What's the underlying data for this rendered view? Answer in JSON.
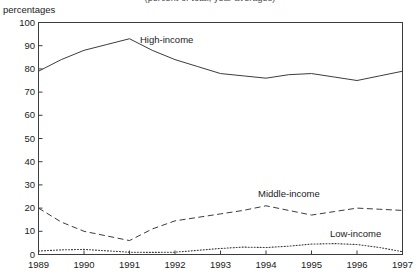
{
  "figure": {
    "clipped_title": "(percent of total, year averages)",
    "unit_label": "percentages"
  },
  "chart_data": {
    "type": "line",
    "title": "",
    "xlabel": "",
    "ylabel": "percentages",
    "ylim": [
      0,
      100
    ],
    "xlim": [
      1989,
      1997
    ],
    "ytick_labels": [
      "0",
      "10",
      "20",
      "30",
      "40",
      "50",
      "60",
      "70",
      "80",
      "90",
      "100"
    ],
    "ytick_values": [
      0,
      10,
      20,
      30,
      40,
      50,
      60,
      70,
      80,
      90,
      100
    ],
    "xtick_labels": [
      "1989",
      "1990",
      "1991",
      "1992",
      "1993",
      "1994",
      "1995",
      "1996",
      "1997"
    ],
    "xtick_values": [
      1989,
      1990,
      1991,
      1992,
      1993,
      1994,
      1995,
      1996,
      1997
    ],
    "grid": false,
    "legend_position": "inline-annotations",
    "x": [
      1989,
      1989.5,
      1990,
      1990.5,
      1991,
      1991.5,
      1992,
      1992.5,
      1993,
      1993.5,
      1994,
      1994.5,
      1995,
      1995.5,
      1996,
      1996.5,
      1997
    ],
    "series": [
      {
        "name": "High-income",
        "style": "solid",
        "color": "#3c3c3c",
        "values": [
          79.0,
          84.0,
          88.0,
          90.5,
          93.0,
          88.0,
          84.0,
          81.0,
          78.0,
          77.0,
          76.0,
          77.5,
          78.0,
          76.5,
          75.0,
          77.0,
          79.0
        ]
      },
      {
        "name": "Middle-income",
        "style": "dashed",
        "color": "#3c3c3c",
        "values": [
          20.0,
          14.0,
          10.0,
          8.0,
          6.0,
          11.0,
          14.5,
          16.0,
          17.5,
          19.0,
          21.0,
          19.0,
          17.0,
          18.5,
          20.0,
          19.5,
          19.0
        ]
      },
      {
        "name": "Low-income",
        "style": "dotted",
        "color": "#3c3c3c",
        "values": [
          1.5,
          2.0,
          2.2,
          1.6,
          1.0,
          0.9,
          1.0,
          1.8,
          2.6,
          3.2,
          3.0,
          3.6,
          4.5,
          4.7,
          4.3,
          3.0,
          1.2
        ]
      }
    ],
    "annotations": [
      {
        "name": "High-income",
        "text": "High-income"
      },
      {
        "name": "Middle-income",
        "text": "Middle-income"
      },
      {
        "name": "Low-income",
        "text": "Low-income"
      }
    ]
  }
}
